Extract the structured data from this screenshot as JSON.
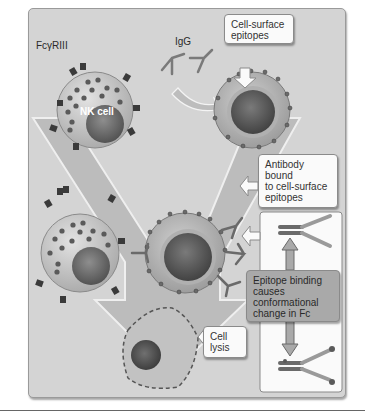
{
  "diagram": {
    "labels": {
      "fc_receptor": "FcγRIII",
      "igg": "IgG",
      "nk_cell": "NK cell"
    },
    "callouts": {
      "cell_surface_epitopes": [
        "Cell-surface",
        "epitopes"
      ],
      "antibody_bound": [
        "Antibody",
        "bound",
        "to cell-surface",
        "epitopes"
      ],
      "epitope_binding": [
        "Epitope binding",
        "causes",
        "conformational",
        "change in Fc"
      ],
      "cell_lysis": [
        "Cell",
        "lysis"
      ]
    },
    "colors": {
      "panel_bg": "#d4d4d4",
      "arrow_fill": "#b8b8b8",
      "cell_body": "#c8c8c8",
      "nucleus": "#6a6a6a",
      "granule": "#5a5a5a",
      "white_box": "#fafafa",
      "gray_box": "#a9a9a9"
    }
  }
}
